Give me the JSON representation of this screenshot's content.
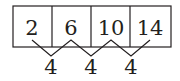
{
  "diagram": {
    "type": "number-sequence-differences",
    "sequence": [
      "2",
      "6",
      "10",
      "14"
    ],
    "differences": [
      "4",
      "4",
      "4"
    ],
    "colors": {
      "stroke": "#231f20",
      "text": "#231f20",
      "background": "#ffffff"
    }
  }
}
